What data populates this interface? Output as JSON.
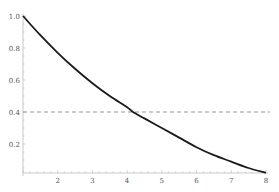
{
  "chart_data": {
    "type": "line",
    "title": "",
    "xlabel": "",
    "ylabel": "",
    "xlim": [
      1,
      8
    ],
    "ylim": [
      0,
      1.0
    ],
    "x_ticks": [
      "2",
      "3",
      "4",
      "5",
      "6",
      "7",
      "8"
    ],
    "y_ticks": [
      "0.2",
      "0.4",
      "0.6",
      "0.8",
      "1.0"
    ],
    "grid": false,
    "series": [
      {
        "name": "curve",
        "color": "#1a1a1a",
        "x": [
          1,
          1.5,
          2,
          2.5,
          3,
          3.5,
          4,
          4.17,
          4.5,
          5,
          5.5,
          6,
          6.5,
          7,
          7.5,
          8
        ],
        "y": [
          1.0,
          0.88,
          0.77,
          0.67,
          0.58,
          0.5,
          0.43,
          0.4,
          0.36,
          0.3,
          0.24,
          0.18,
          0.13,
          0.09,
          0.05,
          0.02
        ]
      }
    ],
    "reference_lines": [
      {
        "orientation": "horizontal",
        "y": 0.4,
        "style": "dashed",
        "color": "#999999"
      }
    ]
  }
}
